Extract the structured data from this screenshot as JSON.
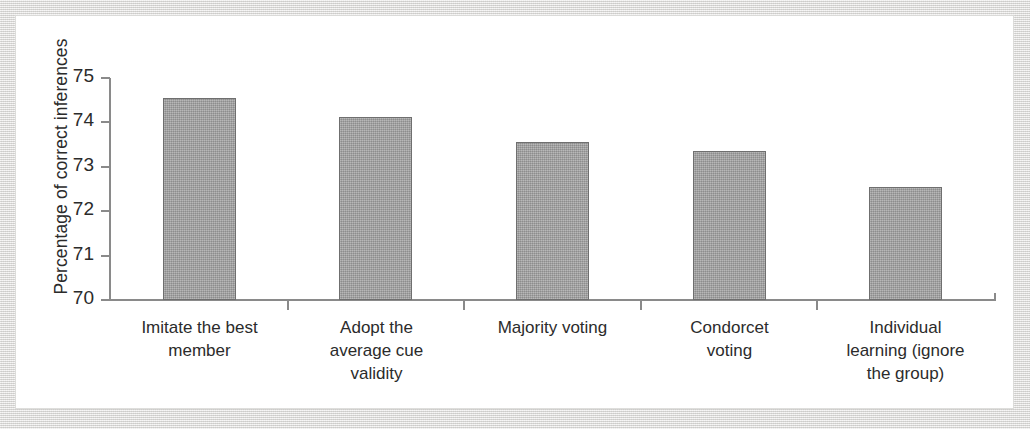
{
  "chart_data": {
    "type": "bar",
    "title": "",
    "xlabel": "",
    "ylabel": "Percentage of correct inferences",
    "ylim": [
      70,
      75
    ],
    "ytick_labels": [
      "75",
      "74",
      "73",
      "72",
      "71",
      "70"
    ],
    "yticks": [
      75,
      74,
      73,
      72,
      71,
      70
    ],
    "grid": false,
    "legend": null,
    "bar_color": "#9a9a9a",
    "bar_edge_color": "#6f6f6f",
    "axis_color": "#8a8a8a",
    "text_color": "#2b2b2b",
    "categories": [
      "Imitate the best member",
      "Adopt the average cue validity",
      "Majority voting",
      "Condorcet voting",
      "Individual learning (ignore the group)"
    ],
    "category_label_lines": [
      [
        "Imitate the best",
        "member"
      ],
      [
        "Adopt the",
        "average cue",
        "validity"
      ],
      [
        "Majority voting"
      ],
      [
        "Condorcet",
        "voting"
      ],
      [
        "Individual",
        "learning (ignore",
        "the group)"
      ]
    ],
    "values": [
      74.55,
      74.13,
      73.55,
      73.35,
      72.55
    ]
  }
}
